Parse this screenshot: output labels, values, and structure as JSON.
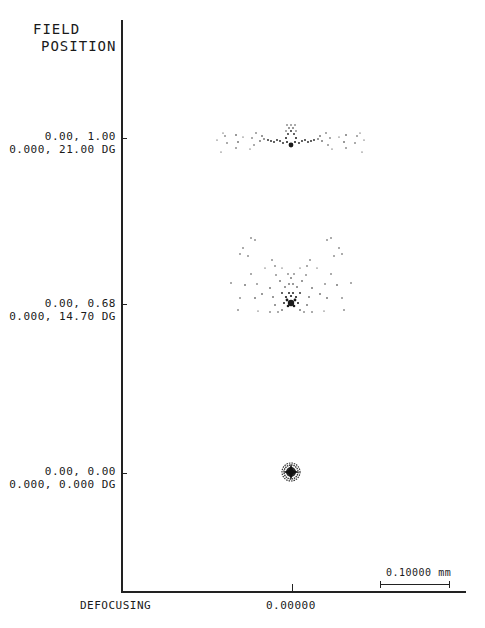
{
  "header": {
    "title_line1": "FIELD",
    "title_line2": "POSITION"
  },
  "fields": [
    {
      "relative": "0.00, 1.00",
      "angle": "0.000, 21.00 DG"
    },
    {
      "relative": "0.00, 0.68",
      "angle": "0.000, 14.70 DG"
    },
    {
      "relative": "0.00, 0.00",
      "angle": "0.000, 0.000 DG"
    }
  ],
  "x_axis": {
    "label": "DEFOCUSING",
    "tick_value": "0.00000"
  },
  "scale": {
    "label": "0.10000 mm"
  },
  "colors": {
    "ink": "#1a1a1a",
    "background": "#ffffff"
  }
}
